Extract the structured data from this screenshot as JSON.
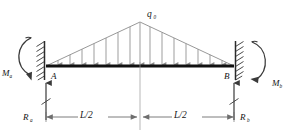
{
  "diagram": {
    "load_label": "q",
    "load_label_sub": "0",
    "node_a_label": "A",
    "node_b_label": "B",
    "moment_a_label": "M",
    "moment_a_sub": "a",
    "moment_b_label": "M",
    "moment_b_sub": "b",
    "reaction_a_label": "R",
    "reaction_a_sub": "a",
    "reaction_b_label": "R",
    "reaction_b_sub": "b",
    "dim_left_label": "L/2",
    "dim_right_label": "L/2",
    "colors": {
      "beam": "#111111",
      "load_line": "#8c8c8c",
      "arrow": "#8c8c8c",
      "support": "#2b2b2b",
      "dimension": "#6e6e6e",
      "text": "#141414",
      "background": "#ffffff"
    },
    "geometry": {
      "beam_left_x": 46,
      "beam_right_x": 234,
      "beam_y": 66,
      "apex_x": 140,
      "apex_y": 22,
      "arrow_count": 15
    }
  }
}
